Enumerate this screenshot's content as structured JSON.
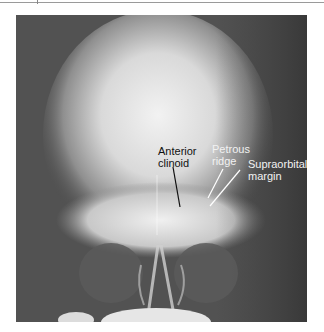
{
  "figure": {
    "type": "radiograph",
    "view": "frontal skull x-ray",
    "colors": {
      "background_dark": "#4a4a4a",
      "cranium_bright": "#e8e8e8",
      "label_dark": "#111111",
      "label_light": "#f2f2f2"
    }
  },
  "labels": {
    "anterior_clinoid": {
      "line1": "Anterior",
      "line2": "clinoid"
    },
    "petrous_ridge": {
      "line1": "Petrous",
      "line2": "ridge"
    },
    "supraorbital_margin": {
      "line1": "Supraorbital",
      "line2": "margin"
    }
  }
}
